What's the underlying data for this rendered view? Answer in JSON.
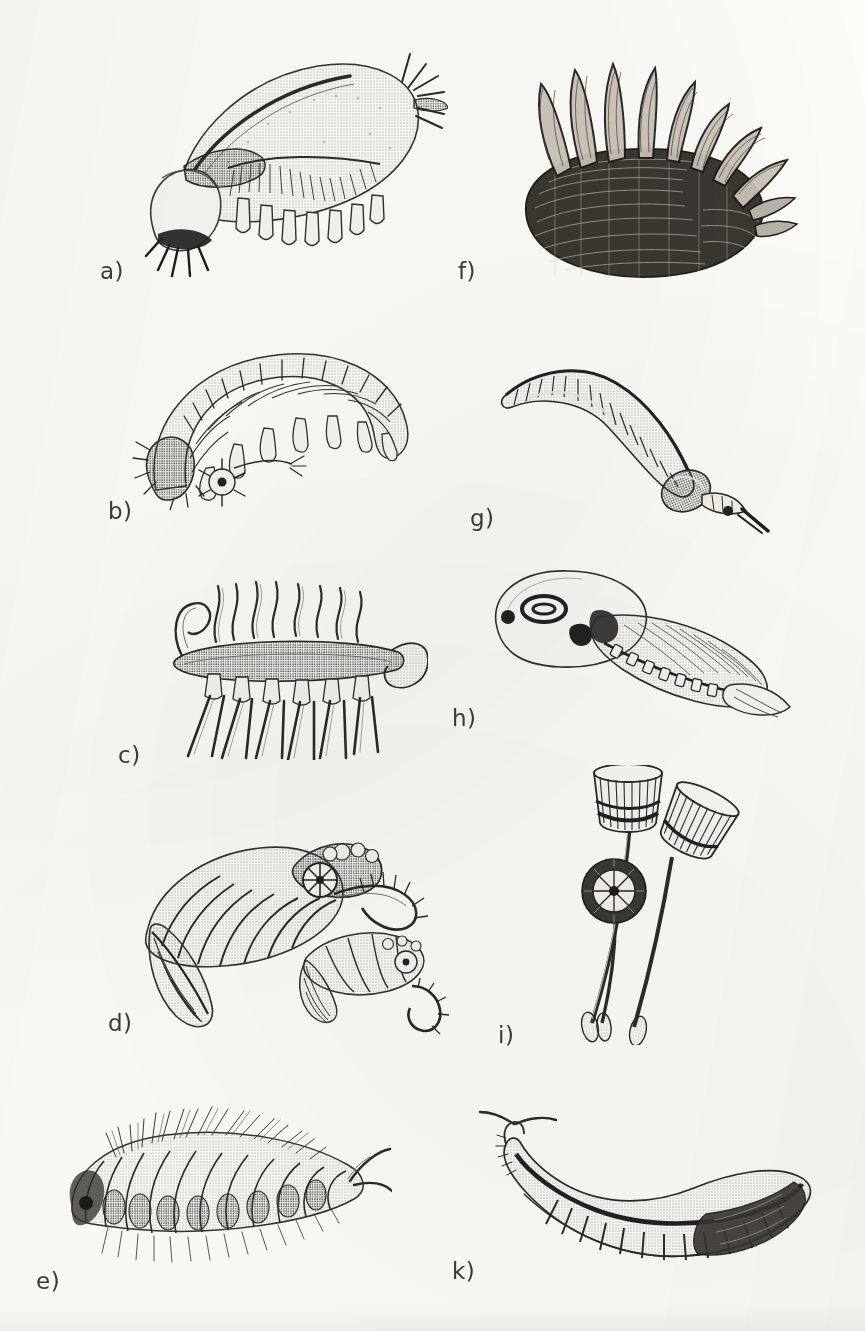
{
  "plate": {
    "kind": "scanned-book-plate",
    "medium": "stippled pen-and-ink scientific illustration",
    "background_color": "#fcfbf8",
    "ink_color": "#2e2c2a",
    "columns": 2,
    "figure_count": 10,
    "label_style": "lowercase letter followed by a close parenthesis"
  },
  "figures": [
    {
      "id": "a",
      "label": "a)",
      "column": "left",
      "row": 1,
      "subject": "armored segmented arthropod with dorsal carapace, tail spines and rows of ventral legs",
      "caption_x": 100,
      "caption_y": 258
    },
    {
      "id": "b",
      "label": "b)",
      "column": "left",
      "row": 2,
      "subject": "arched soft-bodied lobopodian worm with paired stubby legs and head papillae",
      "caption_x": 108,
      "caption_y": 498
    },
    {
      "id": "c",
      "label": "c)",
      "column": "left",
      "row": 3,
      "subject": "spined lobopodian with seven pairs of long dorsal spines and tentacle-like dorsal appendages",
      "caption_x": 118,
      "caption_y": 742
    },
    {
      "id": "d",
      "label": "d)",
      "column": "left",
      "row": 4,
      "subject": "two large predatory arthropods with grasping frontal appendages and lateral swimming flaps",
      "caption_x": 108,
      "caption_y": 1010
    },
    {
      "id": "e",
      "label": "e)",
      "column": "left",
      "row": 5,
      "subject": "bristly segmented polychaete worm with chaetae bundles and paired head tentacles",
      "caption_x": 36,
      "caption_y": 1268
    },
    {
      "id": "f",
      "label": "f)",
      "column": "right",
      "row": 1,
      "subject": "scale-covered slug-like animal bearing two rows of long upright dorsal spines",
      "caption_x": 458,
      "caption_y": 258
    },
    {
      "id": "g",
      "label": "g)",
      "column": "right",
      "row": 2,
      "subject": "curved burrowing priapulid worm with annulated trunk and eversible spiny proboscis",
      "caption_x": 470,
      "caption_y": 505
    },
    {
      "id": "h",
      "label": "h)",
      "column": "right",
      "row": 3,
      "subject": "bivalved arthropod inside a translucent carapace with segmented trunk and tail fan",
      "caption_x": 452,
      "caption_y": 705
    },
    {
      "id": "i",
      "label": "i)",
      "column": "right",
      "row": 4,
      "subject": "three stalked cup-shaped filter feeders with bracts on slender stems and basal holdfasts",
      "caption_x": 498,
      "caption_y": 1022
    },
    {
      "id": "k",
      "label": "k)",
      "column": "right",
      "row": 5,
      "subject": "eel-like chordate with notochord, myotome blocks and a pair of head tentacles",
      "caption_x": 452,
      "caption_y": 1258
    }
  ]
}
